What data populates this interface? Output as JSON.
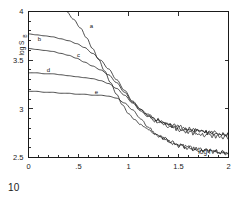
{
  "figure": {
    "number": "10"
  },
  "chart_data": {
    "type": "line",
    "title": "",
    "subtitle": "",
    "xlabel": "log f",
    "ylabel": "log S",
    "ylabel_subscript": "B",
    "xlim": [
      0,
      2
    ],
    "ylim": [
      2.5,
      4
    ],
    "grid": false,
    "legend_position": "inline-curve-labels",
    "xticks": [
      0,
      0.5,
      1,
      1.5,
      2
    ],
    "xticklabels": [
      "0",
      ".5",
      "1",
      "1.5",
      "2"
    ],
    "yticks": [
      2.5,
      3,
      3.5,
      4
    ],
    "yticklabels": [
      "2.5",
      "3",
      "3.5",
      "4"
    ],
    "xminorticks": [
      0.1,
      0.2,
      0.3,
      0.4,
      0.6,
      0.7,
      0.8,
      0.9,
      1.1,
      1.2,
      1.3,
      1.4,
      1.6,
      1.7,
      1.8,
      1.9
    ],
    "yminorticks": [
      2.6,
      2.7,
      2.8,
      2.9,
      3.1,
      3.2,
      3.3,
      3.4,
      3.6,
      3.7,
      3.8,
      3.9
    ],
    "annotations": [
      {
        "text": "a",
        "x": 0.63,
        "y": 3.83
      },
      {
        "text": "b",
        "x": 0.11,
        "y": 3.7
      },
      {
        "text": "c",
        "x": 0.5,
        "y": 3.53
      },
      {
        "text": "d",
        "x": 0.2,
        "y": 3.38
      },
      {
        "text": "e",
        "x": 0.68,
        "y": 3.15
      }
    ],
    "series": [
      {
        "name": "a",
        "label": "a",
        "x": [
          0.38,
          0.45,
          0.52,
          0.58,
          0.64,
          0.7,
          0.76,
          0.82,
          0.88,
          0.94,
          1.0,
          1.06,
          1.12,
          1.18,
          1.24,
          1.3,
          1.36,
          1.42,
          1.48,
          1.54,
          1.6,
          1.66,
          1.72,
          1.78,
          1.84,
          1.9,
          1.96,
          2.0
        ],
        "y": [
          4.0,
          3.92,
          3.83,
          3.73,
          3.62,
          3.51,
          3.39,
          3.27,
          3.15,
          3.04,
          2.95,
          2.89,
          2.84,
          2.8,
          2.76,
          2.72,
          2.69,
          2.66,
          2.64,
          2.62,
          2.6,
          2.59,
          2.58,
          2.57,
          2.56,
          2.56,
          2.55,
          2.55
        ]
      },
      {
        "name": "b",
        "label": "b",
        "x": [
          0.0,
          0.08,
          0.16,
          0.24,
          0.32,
          0.4,
          0.48,
          0.56,
          0.64,
          0.72,
          0.8,
          0.88,
          0.96,
          1.04,
          1.12,
          1.2,
          1.28,
          1.36,
          1.44,
          1.52,
          1.6,
          1.68,
          1.76,
          1.84,
          1.92,
          2.0
        ],
        "y": [
          3.77,
          3.76,
          3.75,
          3.74,
          3.72,
          3.7,
          3.67,
          3.63,
          3.57,
          3.5,
          3.41,
          3.3,
          3.19,
          3.08,
          3.0,
          2.94,
          2.89,
          2.86,
          2.83,
          2.81,
          2.79,
          2.78,
          2.77,
          2.76,
          2.75,
          2.75
        ]
      },
      {
        "name": "c",
        "label": "c",
        "x": [
          0.0,
          0.08,
          0.16,
          0.24,
          0.32,
          0.4,
          0.48,
          0.56,
          0.64,
          0.72,
          0.8,
          0.88,
          0.96,
          1.04,
          1.12,
          1.2,
          1.28,
          1.36,
          1.44,
          1.52,
          1.6,
          1.68,
          1.76,
          1.84,
          1.92,
          2.0
        ],
        "y": [
          3.62,
          3.61,
          3.6,
          3.59,
          3.57,
          3.55,
          3.52,
          3.48,
          3.44,
          3.4,
          3.35,
          3.27,
          3.17,
          3.07,
          2.99,
          2.93,
          2.89,
          2.85,
          2.82,
          2.8,
          2.78,
          2.77,
          2.76,
          2.75,
          2.74,
          2.74
        ]
      },
      {
        "name": "d",
        "label": "d",
        "x": [
          0.0,
          0.08,
          0.16,
          0.24,
          0.32,
          0.4,
          0.48,
          0.56,
          0.64,
          0.72,
          0.8,
          0.88,
          0.96,
          1.04,
          1.12,
          1.2,
          1.28,
          1.36,
          1.44,
          1.52,
          1.6,
          1.68,
          1.76,
          1.84,
          1.92,
          2.0
        ],
        "y": [
          3.37,
          3.37,
          3.36,
          3.36,
          3.35,
          3.34,
          3.33,
          3.32,
          3.31,
          3.29,
          3.26,
          3.21,
          3.14,
          3.06,
          2.98,
          2.92,
          2.87,
          2.83,
          2.8,
          2.78,
          2.76,
          2.74,
          2.73,
          2.72,
          2.71,
          2.71
        ]
      },
      {
        "name": "e",
        "label": "e",
        "x": [
          0.0,
          0.08,
          0.16,
          0.24,
          0.32,
          0.4,
          0.48,
          0.56,
          0.64,
          0.72,
          0.8,
          0.88,
          0.96,
          1.04,
          1.12,
          1.2,
          1.28,
          1.36,
          1.44,
          1.52,
          1.6,
          1.68,
          1.76,
          1.84,
          1.92,
          2.0
        ],
        "y": [
          3.18,
          3.18,
          3.17,
          3.17,
          3.16,
          3.16,
          3.15,
          3.15,
          3.14,
          3.14,
          3.13,
          3.11,
          3.06,
          2.99,
          2.9,
          2.81,
          2.74,
          2.69,
          2.65,
          2.62,
          2.6,
          2.58,
          2.57,
          2.56,
          2.55,
          2.55
        ]
      }
    ],
    "noise": {
      "start_x": 1.05,
      "amplitude": 0.022,
      "description": "high-frequency curves show measurement scatter"
    },
    "colors": {
      "curve": "#111111",
      "axis": "#1a1a1a",
      "background": "#ffffff"
    }
  }
}
